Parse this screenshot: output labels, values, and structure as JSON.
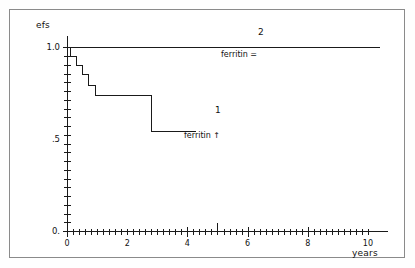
{
  "figure": {
    "border_color": "#8a8a8a",
    "background": "#ffffff",
    "line_color": "#1a1a1a"
  },
  "labels": {
    "ylabel": "efs",
    "xlabel": "years",
    "curve2_number": "2",
    "curve2_group": "ferritin =",
    "curve1_number": "1",
    "curve1_group": "ferritin ↑"
  },
  "axes": {
    "y_tick_labels": [
      "1.0",
      ".5",
      "0."
    ],
    "y_tick_values": [
      1.0,
      0.5,
      0.0
    ],
    "x_tick_labels": [
      "0",
      "2",
      "4",
      "6",
      "8",
      "10"
    ],
    "x_tick_values": [
      0,
      2,
      4,
      6,
      8,
      10
    ],
    "xlim": [
      0,
      10.4
    ],
    "ylim": [
      0,
      1.04
    ],
    "minor_ticks_y": 21,
    "minor_ticks_x": 52,
    "grid": false
  },
  "chart_data": {
    "type": "line",
    "title": "",
    "subtitle": "",
    "xlabel": "years",
    "ylabel": "efs",
    "xlim": [
      0,
      10.4
    ],
    "ylim": [
      0,
      1.04
    ],
    "grid": false,
    "legend_position": "inline-annotations",
    "style": "kaplan-meier step survival curves",
    "series": [
      {
        "name": "2",
        "group": "ferritin =",
        "annotation_number": "2",
        "annotation_text": "ferritin =",
        "step": "post",
        "x": [
          0,
          10.4
        ],
        "values": [
          1.0,
          1.0
        ],
        "points": [
          {
            "x": 0.0,
            "y": 1.0
          },
          {
            "x": 10.4,
            "y": 1.0
          }
        ]
      },
      {
        "name": "1",
        "group": "ferritin ↑",
        "annotation_number": "1",
        "annotation_text": "ferritin ↑",
        "step": "post",
        "x": [
          0.0,
          0.12,
          0.3,
          0.5,
          0.72,
          0.95,
          2.82,
          4.3
        ],
        "values": [
          1.0,
          0.95,
          0.9,
          0.85,
          0.79,
          0.74,
          0.54,
          0.54
        ],
        "points": [
          {
            "x": 0.0,
            "y": 1.0
          },
          {
            "x": 0.12,
            "y": 0.95
          },
          {
            "x": 0.3,
            "y": 0.9
          },
          {
            "x": 0.5,
            "y": 0.85
          },
          {
            "x": 0.72,
            "y": 0.79
          },
          {
            "x": 0.95,
            "y": 0.74
          },
          {
            "x": 2.82,
            "y": 0.54
          },
          {
            "x": 4.3,
            "y": 0.54
          }
        ]
      }
    ]
  }
}
